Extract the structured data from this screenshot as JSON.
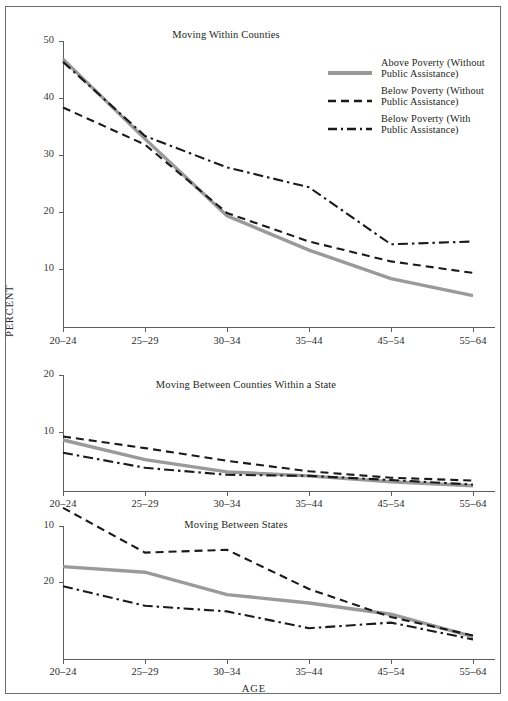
{
  "figure": {
    "top_cut_text": "",
    "y_axis_title": "PERCENT",
    "x_axis_title": "AGE",
    "categories": [
      "20–24",
      "25–29",
      "30–34",
      "35–44",
      "45–54",
      "55–64"
    ]
  },
  "legend": {
    "items": [
      {
        "label_line1": "Above Poverty (Without",
        "label_line2": "Public Assistance)",
        "style": "solid",
        "color": "#9a9a9a",
        "name": "above-poverty-without-public-assistance"
      },
      {
        "label_line1": "Below Poverty (Without",
        "label_line2": "Public Assistance)",
        "style": "dashed",
        "color": "#1a1a1a",
        "name": "below-poverty-without-public-assistance"
      },
      {
        "label_line1": "Below Poverty (With",
        "label_line2": "Public Assistance)",
        "style": "dashdot",
        "color": "#1a1a1a",
        "name": "below-poverty-with-public-assistance"
      }
    ]
  },
  "chart_data": [
    {
      "id": "moving-within-counties",
      "type": "line",
      "title": "Moving Within Counties",
      "xlabel": "",
      "ylabel": "PERCENT",
      "categories": [
        "20–24",
        "25–29",
        "30–34",
        "35–44",
        "45–54",
        "55–64"
      ],
      "yticks": [
        10,
        20,
        30,
        40,
        50
      ],
      "ylim": [
        0,
        50
      ],
      "grid": false,
      "legend_position": "top-right",
      "series": [
        {
          "name": "Above Poverty (Without Public Assistance)",
          "style": "solid",
          "color": "#9a9a9a",
          "values": [
            47.0,
            33.0,
            19.5,
            13.5,
            8.5,
            5.5
          ]
        },
        {
          "name": "Below Poverty (Without Public Assistance)",
          "style": "dashed",
          "color": "#1a1a1a",
          "values": [
            38.5,
            32.0,
            20.0,
            15.0,
            11.5,
            9.5
          ]
        },
        {
          "name": "Below Poverty (With Public Assistance)",
          "style": "dashdot",
          "color": "#1a1a1a",
          "values": [
            46.5,
            33.5,
            28.0,
            24.5,
            14.5,
            15.0
          ]
        }
      ]
    },
    {
      "id": "moving-between-counties-within-a-state",
      "type": "line",
      "title": "Moving Between Counties Within a State",
      "xlabel": "",
      "ylabel": "PERCENT",
      "categories": [
        "20–24",
        "25–29",
        "30–34",
        "35–44",
        "45–54",
        "55–64"
      ],
      "yticks": [
        10,
        20
      ],
      "ylim": [
        0,
        20
      ],
      "grid": false,
      "legend_position": "none",
      "series": [
        {
          "name": "Above Poverty (Without Public Assistance)",
          "style": "solid",
          "color": "#9a9a9a",
          "values": [
            8.8,
            5.4,
            3.3,
            2.6,
            1.6,
            0.9
          ]
        },
        {
          "name": "Below Poverty (Without Public Assistance)",
          "style": "dashed",
          "color": "#1a1a1a",
          "values": [
            9.4,
            7.4,
            5.2,
            3.4,
            2.3,
            1.8
          ]
        },
        {
          "name": "Below Poverty (With Public Assistance)",
          "style": "dashdot",
          "color": "#1a1a1a",
          "values": [
            6.6,
            4.0,
            2.8,
            2.6,
            1.9,
            1.1
          ]
        }
      ]
    },
    {
      "id": "moving-between-states",
      "type": "line",
      "title": "Moving Between States",
      "xlabel": "AGE",
      "ylabel": "PERCENT",
      "categories": [
        "20–24",
        "25–29",
        "30–34",
        "35–44",
        "45–54",
        "55–64"
      ],
      "yticks": [
        10,
        20
      ],
      "ylim": [
        0,
        30
      ],
      "grid": false,
      "legend_position": "none",
      "series": [
        {
          "name": "Above Poverty (Without Public Assistance)",
          "style": "solid",
          "color": "#9a9a9a",
          "values": [
            16.5,
            15.5,
            11.5,
            10.0,
            8.0,
            4.0
          ]
        },
        {
          "name": "Below Poverty (Without Public Assistance)",
          "style": "dashed",
          "color": "#1a1a1a",
          "values": [
            27.0,
            19.0,
            19.5,
            12.5,
            7.5,
            4.2
          ]
        },
        {
          "name": "Below Poverty (With Public Assistance)",
          "style": "dashdot",
          "color": "#1a1a1a",
          "values": [
            13.0,
            9.5,
            8.5,
            5.5,
            6.5,
            3.5
          ]
        }
      ]
    }
  ]
}
